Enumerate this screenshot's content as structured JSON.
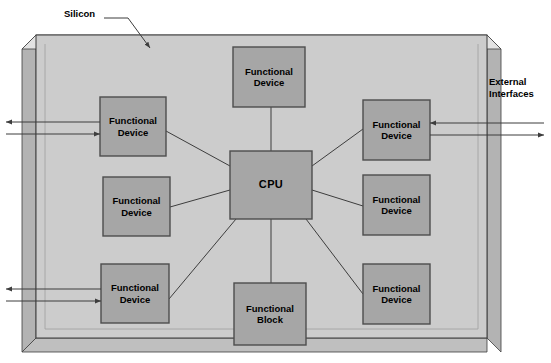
{
  "figure": {
    "background_color": "#ffffff"
  },
  "colors": {
    "silicon_face": "#cccccc",
    "silicon_side": "#b3b3b3",
    "silicon_bottom": "#bfbfbf",
    "block_fill": "#a6a6a6",
    "block_stroke": "#4d4d4d",
    "line": "#3d3d3d",
    "text": "#000000"
  },
  "annotations": {
    "silicon": {
      "label": "Silicon",
      "x": 64,
      "y": 8
    },
    "external_interfaces": {
      "label": "External\nInterfaces",
      "x": 489,
      "y": 76
    }
  },
  "substrate": {
    "name": "Silicon",
    "face": {
      "x": 36,
      "y": 35,
      "width": 451,
      "height": 303
    }
  },
  "blocks": [
    {
      "id": "fd-top",
      "label": "Functional\nDevice",
      "x": 233,
      "y": 47,
      "width": 72,
      "height": 60
    },
    {
      "id": "fd-left-top",
      "label": "Functional\nDevice",
      "x": 100,
      "y": 97,
      "width": 66,
      "height": 59
    },
    {
      "id": "fd-left-mid",
      "label": "Functional\nDevice",
      "x": 103,
      "y": 177,
      "width": 67,
      "height": 59
    },
    {
      "id": "fd-left-bottom",
      "label": "Functional\nDevice",
      "x": 101,
      "y": 264,
      "width": 68,
      "height": 59
    },
    {
      "id": "cpu",
      "label": "CPU",
      "x": 230,
      "y": 151,
      "width": 82,
      "height": 68
    },
    {
      "id": "fb-bottom",
      "label": "Functional\nBlock",
      "x": 234,
      "y": 283,
      "width": 72,
      "height": 62
    },
    {
      "id": "fd-right-top",
      "label": "Functional\nDevice",
      "x": 363,
      "y": 100,
      "width": 67,
      "height": 60
    },
    {
      "id": "fd-right-mid",
      "label": "Functional\nDevice",
      "x": 363,
      "y": 175,
      "width": 67,
      "height": 60
    },
    {
      "id": "fd-right-bottom",
      "label": "Functional\nDevice",
      "x": 363,
      "y": 264,
      "width": 67,
      "height": 60
    }
  ],
  "connections": [
    {
      "from": "cpu",
      "to": "fd-top",
      "x1": 271,
      "y1": 151,
      "x2": 271,
      "y2": 107
    },
    {
      "from": "cpu",
      "to": "fb-bottom",
      "x1": 271,
      "y1": 219,
      "x2": 271,
      "y2": 283
    },
    {
      "from": "cpu",
      "to": "fd-left-top",
      "x1": 230,
      "y1": 166,
      "x2": 166,
      "y2": 131
    },
    {
      "from": "cpu",
      "to": "fd-left-mid",
      "x1": 230,
      "y1": 190,
      "x2": 170,
      "y2": 207
    },
    {
      "from": "cpu",
      "to": "fd-left-bottom",
      "x1": 236,
      "y1": 219,
      "x2": 169,
      "y2": 299
    },
    {
      "from": "cpu",
      "to": "fd-right-top",
      "x1": 312,
      "y1": 166,
      "x2": 363,
      "y2": 129
    },
    {
      "from": "cpu",
      "to": "fd-right-mid",
      "x1": 312,
      "y1": 190,
      "x2": 363,
      "y2": 206
    },
    {
      "from": "cpu",
      "to": "fd-right-bottom",
      "x1": 306,
      "y1": 219,
      "x2": 363,
      "y2": 294
    }
  ],
  "external_interfaces": [
    {
      "id": "ext-left-top-out",
      "direction": "out",
      "side": "left",
      "block": "fd-left-top",
      "y": 122,
      "x_edge": 100,
      "x_tip": 6
    },
    {
      "id": "ext-left-top-in",
      "direction": "in",
      "side": "left",
      "block": "fd-left-top",
      "y": 134,
      "x_edge": 100,
      "x_tip": 6
    },
    {
      "id": "ext-left-bottom-out",
      "direction": "out",
      "side": "left",
      "block": "fd-left-bottom",
      "y": 289,
      "x_edge": 101,
      "x_tip": 6
    },
    {
      "id": "ext-left-bottom-in",
      "direction": "in",
      "side": "left",
      "block": "fd-left-bottom",
      "y": 301,
      "x_edge": 101,
      "x_tip": 6
    },
    {
      "id": "ext-right-top-in",
      "direction": "in",
      "side": "right",
      "block": "fd-right-top",
      "y": 123,
      "x_edge": 430,
      "x_tip": 544
    },
    {
      "id": "ext-right-top-out",
      "direction": "out",
      "side": "right",
      "block": "fd-right-top",
      "y": 135,
      "x_edge": 430,
      "x_tip": 544
    }
  ]
}
